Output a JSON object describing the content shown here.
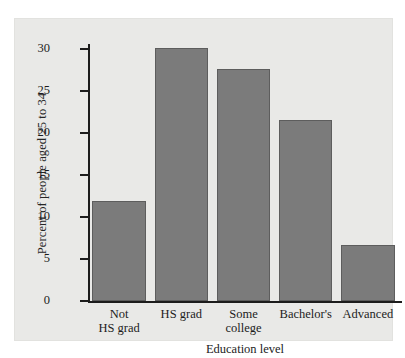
{
  "chart_data": {
    "type": "bar",
    "title": "",
    "xlabel": "Education level",
    "ylabel": "Percent of people aged 25 to 34",
    "categories": [
      "Not\nHS grad",
      "HS grad",
      "Some\ncollege",
      "Bachelor's",
      "Advanced"
    ],
    "values": [
      11.9,
      30.1,
      27.6,
      21.6,
      6.7
    ],
    "ylim": [
      0,
      31
    ],
    "yticks": [
      0,
      5,
      10,
      15,
      20,
      25,
      30
    ],
    "ytick_labels": [
      "0",
      "5",
      "10",
      "15",
      "20",
      "25",
      "30"
    ],
    "grid": false,
    "legend": null,
    "bar_color": "#7b7b7b",
    "bar_edge_color": "#5d5d5d",
    "panel_color": "#e9e9e7",
    "axis_color": "#1c1c1c"
  }
}
